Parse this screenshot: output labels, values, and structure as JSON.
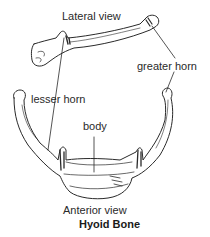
{
  "figure": {
    "title": "Hyoid Bone",
    "views": {
      "lateral": "Lateral view",
      "anterior": "Anterior view"
    },
    "labels": {
      "greater_horn": "greater horn",
      "lesser_horn": "lesser horn",
      "body": "body"
    }
  }
}
